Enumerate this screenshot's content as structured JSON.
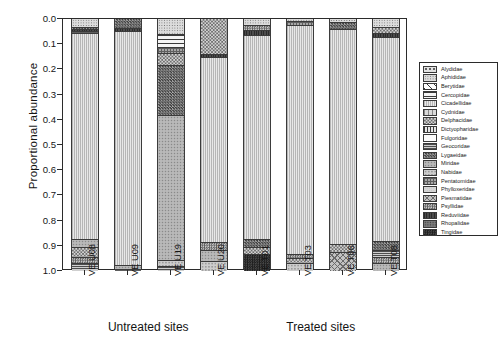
{
  "chart_data": {
    "type": "bar",
    "title": "",
    "subtitle": "",
    "xlabel": "",
    "ylabel": "Proportional abundance",
    "ylim": [
      0.0,
      1.0
    ],
    "y_inverted": true,
    "grid": false,
    "legend_position": "right",
    "stacked": true,
    "normalized": true,
    "ytick_labels": [
      "0.0",
      "0.1",
      "0.2",
      "0.3",
      "0.4",
      "0.5",
      "0.6",
      "0.7",
      "0.8",
      "0.9",
      "1.0"
    ],
    "ytick_values": [
      0.0,
      0.1,
      0.2,
      0.3,
      0.4,
      0.5,
      0.6,
      0.7,
      0.8,
      0.9,
      1.0
    ],
    "categories": [
      "VE U08",
      "VE U09",
      "VE U19",
      "VE U20",
      "VE T01",
      "VE T03",
      "VE T06",
      "VE T08"
    ],
    "groups": [
      {
        "label": "Untreated sites",
        "categories": [
          "VE U08",
          "VE U09",
          "VE U19",
          "VE U20"
        ]
      },
      {
        "label": "Treated sites",
        "categories": [
          "VE T01",
          "VE T03",
          "VE T06",
          "VE T08"
        ]
      }
    ],
    "series": [
      {
        "name": "Alydidae",
        "pattern": "coarse-dots",
        "color": "#d9d9d9",
        "values": [
          0.0,
          0.0,
          0.0,
          0.0,
          0.0,
          0.0,
          0.0,
          0.0
        ]
      },
      {
        "name": "Aphididae",
        "pattern": "fine-speckle",
        "color": "#cccccc",
        "values": [
          0.03,
          0.0,
          0.058,
          0.0,
          0.022,
          0.008,
          0.012,
          0.03
        ]
      },
      {
        "name": "Berytidae",
        "pattern": "diagonal-lines",
        "color": "#ffffff",
        "values": [
          0.0,
          0.0,
          0.0,
          0.0,
          0.0,
          0.0,
          0.0,
          0.0
        ]
      },
      {
        "name": "Cercopidae",
        "pattern": "horiz-lines",
        "color": "#e6e6e6",
        "values": [
          0.0,
          0.0,
          0.052,
          0.0,
          0.0,
          0.0,
          0.0,
          0.0
        ]
      },
      {
        "name": "Cicadellidae",
        "pattern": "vert-fine",
        "color": "#dedede",
        "values": [
          0.828,
          0.932,
          0.0,
          0.752,
          0.834,
          0.922,
          0.872,
          0.8
        ]
      },
      {
        "name": "Cydnidae",
        "pattern": "vert-thick",
        "color": "#bdbdbd",
        "values": [
          0.0,
          0.0,
          0.0,
          0.0,
          0.0,
          0.0,
          0.0,
          0.0
        ]
      },
      {
        "name": "Delphacidae",
        "pattern": "checker",
        "color": "#8f8f8f",
        "values": [
          0.012,
          0.038,
          0.07,
          0.138,
          0.02,
          0.012,
          0.024,
          0.046
        ]
      },
      {
        "name": "Dictyopharidae",
        "pattern": "vert-bars",
        "color": "#c4c4c4",
        "values": [
          0.0,
          0.0,
          0.0,
          0.0,
          0.0,
          0.0,
          0.0,
          0.0
        ]
      },
      {
        "name": "Fulgoridae",
        "pattern": "solid-white",
        "color": "#fbfbfb",
        "values": [
          0.0,
          0.0,
          0.0,
          0.0,
          0.0,
          0.0,
          0.0,
          0.0
        ]
      },
      {
        "name": "Geocoridae",
        "pattern": "dense-horiz",
        "color": "#a8a8a8",
        "values": [
          0.014,
          0.0,
          0.02,
          0.012,
          0.0,
          0.0,
          0.0,
          0.014
        ]
      },
      {
        "name": "Lygaeidae",
        "pattern": "dark-checker",
        "color": "#6a6a6a",
        "values": [
          0.028,
          0.0,
          0.2,
          0.01,
          0.034,
          0.0,
          0.03,
          0.036
        ]
      },
      {
        "name": "Miridae",
        "pattern": "mid-speckle",
        "color": "#b0b0b0",
        "values": [
          0.044,
          0.014,
          0.47,
          0.056,
          0.022,
          0.038,
          0.032,
          0.03
        ]
      },
      {
        "name": "Nabidae",
        "pattern": "light-speckle",
        "color": "#c8c8c8",
        "values": [
          0.012,
          0.0,
          0.06,
          0.01,
          0.01,
          0.01,
          0.01,
          0.01
        ]
      },
      {
        "name": "Pentatomidae",
        "pattern": "grid-hatch",
        "color": "#9a9a9a",
        "values": [
          0.012,
          0.008,
          0.04,
          0.01,
          0.018,
          0.004,
          0.008,
          0.014
        ]
      },
      {
        "name": "Phylloxeridae",
        "pattern": "pale-fill",
        "color": "#d2d2d2",
        "values": [
          0.0,
          0.0,
          0.0,
          0.0,
          0.0,
          0.0,
          0.0,
          0.0
        ]
      },
      {
        "name": "Piesmatidae",
        "pattern": "cross-hatch",
        "color": "#bbbbbb",
        "values": [
          0.0,
          0.0,
          0.0,
          0.0,
          0.0,
          0.0,
          0.0,
          0.0
        ]
      },
      {
        "name": "Psyllidae",
        "pattern": "diag-checker",
        "color": "#a0a0a0",
        "values": [
          0.01,
          0.004,
          0.02,
          0.006,
          0.02,
          0.006,
          0.012,
          0.01
        ]
      },
      {
        "name": "Reduviidae",
        "pattern": "dark-solid",
        "color": "#3f3f3f",
        "values": [
          0.01,
          0.004,
          0.01,
          0.006,
          0.02,
          0.0,
          0.0,
          0.01
        ]
      },
      {
        "name": "Rhopalidae",
        "pattern": "dark-speckle",
        "color": "#7a7a7a",
        "values": [
          0.0,
          0.0,
          0.0,
          0.0,
          0.0,
          0.0,
          0.0,
          0.0
        ]
      },
      {
        "name": "Tingidae",
        "pattern": "near-black",
        "color": "#2e2e2e",
        "values": [
          0.0,
          0.0,
          0.0,
          0.0,
          0.0,
          0.0,
          0.0,
          0.0
        ]
      }
    ],
    "bars": [
      {
        "category": "VE U08",
        "segments": [
          {
            "name": "Aphididae",
            "pattern": "fine-speckle",
            "from": 0.0,
            "to": 0.03
          },
          {
            "name": "Lygaeidae",
            "pattern": "dark-checker",
            "from": 0.03,
            "to": 0.04
          },
          {
            "name": "Reduviidae",
            "pattern": "dark-solid",
            "from": 0.04,
            "to": 0.048
          },
          {
            "name": "Pentatomidae",
            "pattern": "grid-hatch",
            "from": 0.048,
            "to": 0.056
          },
          {
            "name": "Cicadellidae",
            "pattern": "vert-fine",
            "from": 0.056,
            "to": 0.872
          },
          {
            "name": "Miridae",
            "pattern": "mid-speckle",
            "from": 0.872,
            "to": 0.904
          },
          {
            "name": "Delphacidae",
            "pattern": "checker",
            "from": 0.904,
            "to": 0.944
          },
          {
            "name": "Psyllidae",
            "pattern": "diag-checker",
            "from": 0.944,
            "to": 0.968
          },
          {
            "name": "Geocoridae",
            "pattern": "dense-horiz",
            "from": 0.968,
            "to": 1.0
          }
        ]
      },
      {
        "category": "VE U09",
        "segments": [
          {
            "name": "Lygaeidae",
            "pattern": "dark-checker",
            "from": 0.0,
            "to": 0.036
          },
          {
            "name": "Reduviidae",
            "pattern": "dark-solid",
            "from": 0.036,
            "to": 0.048
          },
          {
            "name": "Cicadellidae",
            "pattern": "vert-fine",
            "from": 0.048,
            "to": 0.978
          },
          {
            "name": "Miridae",
            "pattern": "mid-speckle",
            "from": 0.978,
            "to": 0.992
          },
          {
            "name": "Pentatomidae",
            "pattern": "grid-hatch",
            "from": 0.992,
            "to": 1.0
          }
        ]
      },
      {
        "category": "VE U19",
        "segments": [
          {
            "name": "Aphididae",
            "pattern": "fine-speckle",
            "from": 0.0,
            "to": 0.058
          },
          {
            "name": "Cercopidae",
            "pattern": "horiz-lines",
            "from": 0.058,
            "to": 0.11
          },
          {
            "name": "Pentatomidae",
            "pattern": "grid-hatch",
            "from": 0.11,
            "to": 0.134
          },
          {
            "name": "Delphacidae",
            "pattern": "checker",
            "from": 0.134,
            "to": 0.182
          },
          {
            "name": "Lygaeidae",
            "pattern": "dark-checker",
            "from": 0.182,
            "to": 0.382
          },
          {
            "name": "Miridae",
            "pattern": "mid-speckle",
            "from": 0.382,
            "to": 0.956
          },
          {
            "name": "Nabidae",
            "pattern": "light-speckle",
            "from": 0.956,
            "to": 0.98
          },
          {
            "name": "Geocoridae",
            "pattern": "dense-horiz",
            "from": 0.98,
            "to": 1.0
          }
        ]
      },
      {
        "category": "VE U20",
        "segments": [
          {
            "name": "Delphacidae",
            "pattern": "checker",
            "from": 0.0,
            "to": 0.138
          },
          {
            "name": "Reduviidae",
            "pattern": "dark-solid",
            "from": 0.138,
            "to": 0.152
          },
          {
            "name": "Cicadellidae",
            "pattern": "vert-fine",
            "from": 0.152,
            "to": 0.884
          },
          {
            "name": "Psyllidae",
            "pattern": "diag-checker",
            "from": 0.884,
            "to": 0.918
          },
          {
            "name": "Miridae",
            "pattern": "mid-speckle",
            "from": 0.918,
            "to": 0.962
          },
          {
            "name": "Nabidae",
            "pattern": "light-speckle",
            "from": 0.962,
            "to": 1.0
          }
        ]
      },
      {
        "category": "VE T01",
        "segments": [
          {
            "name": "Aphididae",
            "pattern": "fine-speckle",
            "from": 0.0,
            "to": 0.022
          },
          {
            "name": "Psyllidae",
            "pattern": "diag-checker",
            "from": 0.022,
            "to": 0.044
          },
          {
            "name": "Reduviidae",
            "pattern": "dark-solid",
            "from": 0.044,
            "to": 0.062
          },
          {
            "name": "Cicadellidae",
            "pattern": "vert-fine",
            "from": 0.062,
            "to": 0.872
          },
          {
            "name": "Lygaeidae",
            "pattern": "dark-checker",
            "from": 0.872,
            "to": 0.906
          },
          {
            "name": "Delphacidae",
            "pattern": "checker",
            "from": 0.906,
            "to": 0.934
          },
          {
            "name": "Tingidae",
            "pattern": "near-black",
            "from": 0.934,
            "to": 1.0
          }
        ]
      },
      {
        "category": "VE T03",
        "segments": [
          {
            "name": "Aphididae",
            "pattern": "fine-speckle",
            "from": 0.0,
            "to": 0.008
          },
          {
            "name": "Pentatomidae",
            "pattern": "grid-hatch",
            "from": 0.008,
            "to": 0.022
          },
          {
            "name": "Cicadellidae",
            "pattern": "vert-fine",
            "from": 0.022,
            "to": 0.932
          },
          {
            "name": "Psyllidae",
            "pattern": "diag-checker",
            "from": 0.932,
            "to": 0.95
          },
          {
            "name": "Delphacidae",
            "pattern": "checker",
            "from": 0.95,
            "to": 0.968
          },
          {
            "name": "Nabidae",
            "pattern": "light-speckle",
            "from": 0.968,
            "to": 1.0
          }
        ]
      },
      {
        "category": "VE T06",
        "segments": [
          {
            "name": "Aphididae",
            "pattern": "fine-speckle",
            "from": 0.0,
            "to": 0.012
          },
          {
            "name": "Lygaeidae",
            "pattern": "dark-checker",
            "from": 0.012,
            "to": 0.038
          },
          {
            "name": "Cicadellidae",
            "pattern": "vert-fine",
            "from": 0.038,
            "to": 0.892
          },
          {
            "name": "Delphacidae",
            "pattern": "checker",
            "from": 0.892,
            "to": 0.926
          },
          {
            "name": "Piesmatidae",
            "pattern": "cross-hatch",
            "from": 0.926,
            "to": 1.0
          }
        ]
      },
      {
        "category": "VE T08",
        "segments": [
          {
            "name": "Aphididae",
            "pattern": "fine-speckle",
            "from": 0.0,
            "to": 0.03
          },
          {
            "name": "Delphacidae",
            "pattern": "checker",
            "from": 0.03,
            "to": 0.054
          },
          {
            "name": "Reduviidae",
            "pattern": "dark-solid",
            "from": 0.054,
            "to": 0.07
          },
          {
            "name": "Cicadellidae",
            "pattern": "vert-fine",
            "from": 0.07,
            "to": 0.88
          },
          {
            "name": "Lygaeidae",
            "pattern": "dark-checker",
            "from": 0.88,
            "to": 0.916
          },
          {
            "name": "Geocoridae",
            "pattern": "dense-horiz",
            "from": 0.916,
            "to": 0.946
          },
          {
            "name": "Psyllidae",
            "pattern": "diag-checker",
            "from": 0.946,
            "to": 0.97
          },
          {
            "name": "Miridae",
            "pattern": "mid-speckle",
            "from": 0.97,
            "to": 1.0
          }
        ]
      }
    ]
  },
  "legend": {
    "entries": [
      {
        "label": "Alydidae",
        "pattern": "coarse-dots"
      },
      {
        "label": "Aphididae",
        "pattern": "fine-speckle"
      },
      {
        "label": "Berytidae",
        "pattern": "diagonal-lines"
      },
      {
        "label": "Cercopidae",
        "pattern": "horiz-lines"
      },
      {
        "label": "Cicadellidae",
        "pattern": "vert-fine"
      },
      {
        "label": "Cydnidae",
        "pattern": "vert-thick"
      },
      {
        "label": "Delphacidae",
        "pattern": "checker"
      },
      {
        "label": "Dictyopharidae",
        "pattern": "vert-bars"
      },
      {
        "label": "Fulgoridae",
        "pattern": "solid-white"
      },
      {
        "label": "Geocoridae",
        "pattern": "dense-horiz"
      },
      {
        "label": "Lygaeidae",
        "pattern": "dark-checker"
      },
      {
        "label": "Miridae",
        "pattern": "mid-speckle"
      },
      {
        "label": "Nabidae",
        "pattern": "light-speckle"
      },
      {
        "label": "Pentatomidae",
        "pattern": "grid-hatch"
      },
      {
        "label": "Phylloxeridae",
        "pattern": "pale-fill"
      },
      {
        "label": "Piesmatidae",
        "pattern": "cross-hatch"
      },
      {
        "label": "Psyllidae",
        "pattern": "diag-checker"
      },
      {
        "label": "Reduviidae",
        "pattern": "dark-solid"
      },
      {
        "label": "Rhopalidae",
        "pattern": "dark-speckle"
      },
      {
        "label": "Tingidae",
        "pattern": "near-black"
      }
    ]
  },
  "caption": ""
}
